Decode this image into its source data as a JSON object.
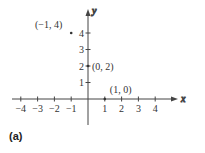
{
  "figure_label": "(a)",
  "chart_data": {
    "type": "scatter",
    "title": "",
    "xlabel": "x",
    "ylabel": "y",
    "xlim": [
      -4,
      4
    ],
    "ylim": [
      -1,
      5
    ],
    "grid": false,
    "x_ticks": [
      "-4",
      "-3",
      "-2",
      "-1",
      "1",
      "2",
      "3",
      "4"
    ],
    "y_ticks": [
      "1",
      "2",
      "3",
      "4"
    ],
    "points": [
      {
        "x": -1,
        "y": 4,
        "label": "(-1, 4)"
      },
      {
        "x": 0,
        "y": 2,
        "label": "(0, 2)"
      },
      {
        "x": 1,
        "y": 0,
        "label": "(1, 0)"
      }
    ]
  }
}
